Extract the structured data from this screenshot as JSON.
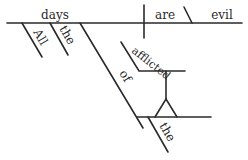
{
  "diagram": {
    "type": "Reed-Kellogg sentence diagram",
    "sentence_words": {
      "subject": "days",
      "verb": "are",
      "predicate_adjective": "evil",
      "modifiers_subject": [
        "All",
        "the"
      ],
      "preposition": "of",
      "participle": "afflicted",
      "object_modifier": "the"
    },
    "colors": {
      "ink": "#2a2a2a",
      "background": "#ffffff"
    }
  }
}
